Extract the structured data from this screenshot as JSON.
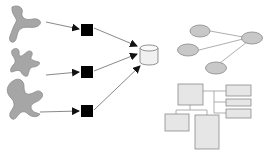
{
  "diagram": {
    "title": "",
    "colors": {
      "blob_fill": "#a6a6a6",
      "blob_stroke": "#8c8c8c",
      "square_fill": "#000000",
      "arrow": "#555555",
      "cylinder_fill": "#f0f0f0",
      "cylinder_stroke": "#777777",
      "ellipse_fill": "#c8c8c8",
      "ellipse_stroke": "#888888",
      "box_fill": "#e6e6e6",
      "box_stroke": "#8a8a8a",
      "edge": "#999999"
    },
    "sources": [
      {
        "name": "irregular-shape-1"
      },
      {
        "name": "irregular-shape-2"
      },
      {
        "name": "irregular-shape-3"
      }
    ],
    "processors": [
      {
        "name": "black-square-1"
      },
      {
        "name": "black-square-2"
      },
      {
        "name": "black-square-3"
      }
    ],
    "store": {
      "name": "database-cylinder"
    },
    "graph": {
      "nodes": [
        "node-top-left",
        "node-middle-left",
        "node-bottom",
        "node-hub-right"
      ],
      "edges": [
        [
          "node-top-left",
          "node-hub-right"
        ],
        [
          "node-middle-left",
          "node-hub-right"
        ],
        [
          "node-bottom",
          "node-hub-right"
        ]
      ]
    },
    "hierarchy": {
      "root": "main-box",
      "right_children": [
        "child-box-1",
        "child-box-2",
        "child-box-3"
      ],
      "bottom_children": [
        "child-box-bottom-left",
        "child-box-bottom-right"
      ]
    }
  }
}
